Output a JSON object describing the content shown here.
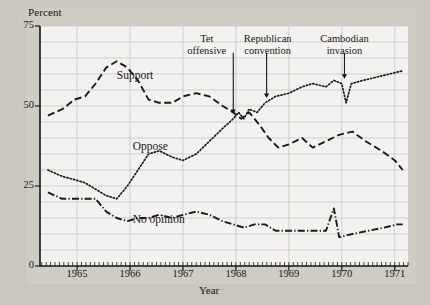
{
  "chart_data": {
    "type": "line",
    "title": "",
    "xlabel": "Year",
    "ylabel": "Percent",
    "xlim": [
      1964.3,
      1971.25
    ],
    "ylim": [
      0,
      75
    ],
    "yticks": [
      0,
      25,
      50,
      75
    ],
    "ytick_labels": [
      "0",
      "25",
      "50",
      "75"
    ],
    "xticks": [
      1965,
      1966,
      1967,
      1968,
      1969,
      1970,
      1971
    ],
    "xtick_labels": [
      "1965",
      "1966",
      "1967",
      "1968",
      "1969",
      "1970",
      "1971"
    ],
    "grid": "horizontal every 5 percent, vertical at each year",
    "minor_ticks": "monthly on x-axis",
    "legend": "inline series labels",
    "series": [
      {
        "name": "Support",
        "style": "dashed",
        "label_x": 1965.75,
        "label_y": 59,
        "points": [
          [
            1964.45,
            47
          ],
          [
            1964.72,
            49
          ],
          [
            1964.95,
            52
          ],
          [
            1965.15,
            53
          ],
          [
            1965.35,
            57
          ],
          [
            1965.55,
            62
          ],
          [
            1965.75,
            64
          ],
          [
            1965.95,
            62
          ],
          [
            1966.15,
            58
          ],
          [
            1966.35,
            52
          ],
          [
            1966.55,
            51
          ],
          [
            1966.8,
            51
          ],
          [
            1967.0,
            53
          ],
          [
            1967.25,
            54
          ],
          [
            1967.5,
            53
          ],
          [
            1967.75,
            50
          ],
          [
            1967.95,
            48
          ],
          [
            1968.1,
            46
          ],
          [
            1968.25,
            48
          ],
          [
            1968.45,
            44
          ],
          [
            1968.62,
            40
          ],
          [
            1968.8,
            37
          ],
          [
            1969.0,
            38
          ],
          [
            1969.25,
            40
          ],
          [
            1969.45,
            37
          ],
          [
            1969.7,
            39
          ],
          [
            1969.95,
            41
          ],
          [
            1970.2,
            42
          ],
          [
            1970.45,
            39
          ],
          [
            1970.75,
            36
          ],
          [
            1971.0,
            33
          ],
          [
            1971.15,
            30
          ]
        ]
      },
      {
        "name": "Oppose",
        "style": "dotted",
        "label_x": 1966.05,
        "label_y": 37,
        "points": [
          [
            1964.45,
            30
          ],
          [
            1964.72,
            28
          ],
          [
            1964.95,
            27
          ],
          [
            1965.15,
            26
          ],
          [
            1965.35,
            24
          ],
          [
            1965.55,
            22
          ],
          [
            1965.75,
            21
          ],
          [
            1965.95,
            25
          ],
          [
            1966.15,
            30
          ],
          [
            1966.35,
            35
          ],
          [
            1966.55,
            36
          ],
          [
            1966.8,
            34
          ],
          [
            1967.0,
            33
          ],
          [
            1967.25,
            35
          ],
          [
            1967.5,
            39
          ],
          [
            1967.75,
            43
          ],
          [
            1967.95,
            46
          ],
          [
            1968.05,
            48
          ],
          [
            1968.15,
            46
          ],
          [
            1968.25,
            49
          ],
          [
            1968.4,
            48
          ],
          [
            1968.55,
            51
          ],
          [
            1968.75,
            53
          ],
          [
            1969.0,
            54
          ],
          [
            1969.25,
            56
          ],
          [
            1969.45,
            57
          ],
          [
            1969.7,
            56
          ],
          [
            1969.85,
            58
          ],
          [
            1970.0,
            57
          ],
          [
            1970.08,
            51
          ],
          [
            1970.18,
            57
          ],
          [
            1970.4,
            58
          ],
          [
            1970.65,
            59
          ],
          [
            1970.9,
            60
          ],
          [
            1971.15,
            61
          ]
        ]
      },
      {
        "name": "No opinion",
        "style": "dash-dot",
        "label_x": 1966.05,
        "label_y": 14,
        "points": [
          [
            1964.45,
            23
          ],
          [
            1964.72,
            21
          ],
          [
            1964.95,
            21
          ],
          [
            1965.15,
            21
          ],
          [
            1965.35,
            21
          ],
          [
            1965.55,
            17
          ],
          [
            1965.75,
            15
          ],
          [
            1965.95,
            14
          ],
          [
            1966.15,
            15
          ],
          [
            1966.35,
            15
          ],
          [
            1966.55,
            16
          ],
          [
            1966.8,
            15
          ],
          [
            1967.0,
            16
          ],
          [
            1967.25,
            17
          ],
          [
            1967.5,
            16
          ],
          [
            1967.75,
            14
          ],
          [
            1967.95,
            13
          ],
          [
            1968.15,
            12
          ],
          [
            1968.35,
            13
          ],
          [
            1968.55,
            13
          ],
          [
            1968.75,
            11
          ],
          [
            1969.0,
            11
          ],
          [
            1969.25,
            11
          ],
          [
            1969.5,
            11
          ],
          [
            1969.7,
            11
          ],
          [
            1969.85,
            18
          ],
          [
            1969.95,
            9
          ],
          [
            1970.2,
            10
          ],
          [
            1970.5,
            11
          ],
          [
            1970.8,
            12
          ],
          [
            1971.05,
            13
          ],
          [
            1971.15,
            13
          ]
        ]
      }
    ],
    "annotations": [
      {
        "name": "tet-offensive",
        "line1": "Tet",
        "line2": "offensive",
        "x": 1967.95,
        "text_x": 1967.45,
        "text_y": 71,
        "arrow_to_y": 47.5
      },
      {
        "name": "republican-convention",
        "line1": "Republican",
        "line2": "convention",
        "x": 1968.58,
        "text_x": 1968.6,
        "text_y": 71,
        "arrow_to_y": 52.5
      },
      {
        "name": "cambodian-invasion",
        "line1": "Cambodian",
        "line2": "invasion",
        "x": 1970.05,
        "text_x": 1970.05,
        "text_y": 71,
        "arrow_to_y": 58.5
      }
    ]
  }
}
